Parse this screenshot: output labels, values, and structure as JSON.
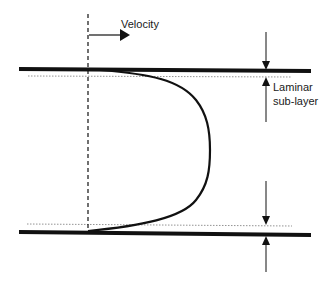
{
  "diagram": {
    "labels": {
      "velocity": "Velocity",
      "laminar_line1": "Laminar",
      "laminar_line2": "sub-layer"
    },
    "colors": {
      "ink": "#111111",
      "dotted": "#777777",
      "background": "#ffffff"
    },
    "elements": [
      "top-wall",
      "bottom-wall",
      "top-sublayer-boundary",
      "bottom-sublayer-boundary",
      "centerline-reference",
      "velocity-arrow",
      "velocity-profile-curve",
      "top-dimension-arrows",
      "bottom-dimension-arrows"
    ]
  }
}
